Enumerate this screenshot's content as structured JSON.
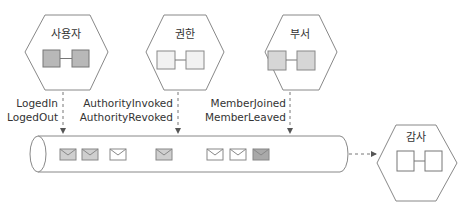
{
  "services": [
    {
      "name": "사용자",
      "box_fill": "#b8b8b8"
    },
    {
      "name": "권한",
      "box_fill": "#f2f2f2"
    },
    {
      "name": "부서",
      "box_fill": "#d6d6d6"
    }
  ],
  "audit_service": {
    "name": "감사",
    "box_fill": "#ffffff"
  },
  "event_labels": [
    {
      "lines": [
        "LogedIn",
        "LogedOut"
      ]
    },
    {
      "lines": [
        "AuthorityInvoked",
        "AuthorityRevoked"
      ]
    },
    {
      "lines": [
        "MemberJoined",
        "MemberLeaved"
      ]
    }
  ],
  "queue": {
    "messages": [
      {
        "fill": "#cfcfcf"
      },
      {
        "fill": "#cfcfcf"
      },
      {
        "fill": "#ffffff"
      },
      {
        "fill": "#cfcfcf"
      },
      {
        "fill": "#ffffff"
      },
      {
        "fill": "#ffffff"
      },
      {
        "fill": "#a9a9a9"
      }
    ]
  },
  "colors": {
    "stroke": "#777777",
    "dash": "#777777"
  }
}
